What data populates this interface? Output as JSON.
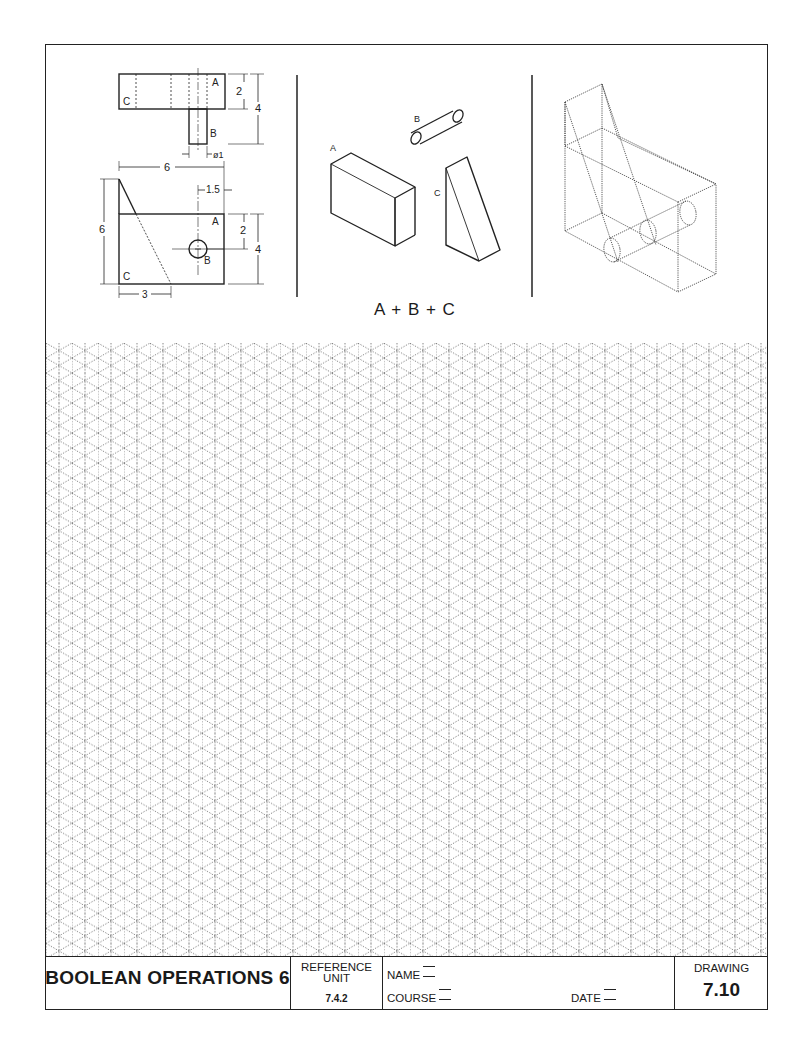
{
  "sheet": {
    "title": "BOOLEAN OPERATIONS 6",
    "reference_unit_label": "REFERENCE UNIT",
    "reference_unit_line1": "REFERENCE",
    "reference_unit_line2": "UNIT",
    "reference_unit_value": "7.4.2",
    "name_label": "NAME",
    "course_label": "COURSE",
    "date_label": "DATE",
    "drawing_label": "DRAWING",
    "drawing_number": "7.10"
  },
  "orthographic_views": {
    "top_view": {
      "labels": [
        "A",
        "B",
        "C"
      ],
      "dimensions": {
        "height_A": "2",
        "total_height": "4",
        "diameter_B": "ø1"
      }
    },
    "front_view": {
      "labels": [
        "A",
        "B",
        "C"
      ],
      "dimensions": {
        "width": "6",
        "height": "6",
        "hole_offset": "1.5",
        "hole_height": "2",
        "block_height": "4",
        "wedge_base": "3"
      }
    }
  },
  "isometric_parts": {
    "labels": {
      "a": "A",
      "b": "B",
      "c": "C"
    },
    "formula": "A + B + C"
  },
  "grid": {
    "type": "isometric",
    "spacing_px": 13,
    "line_color": "#555555"
  },
  "colors": {
    "ink": "#222222",
    "paper": "#ffffff"
  }
}
